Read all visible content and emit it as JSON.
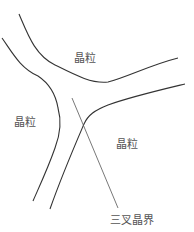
{
  "diagram": {
    "type": "grain-boundary-schematic",
    "labels": {
      "grain_top": "晶粒",
      "grain_left": "晶粒",
      "grain_right": "晶粒",
      "triple_junction": "三叉晶界"
    },
    "colors": {
      "boundary": "#333333",
      "pointer": "#555555",
      "text": "#555555",
      "background": "#ffffff"
    }
  }
}
